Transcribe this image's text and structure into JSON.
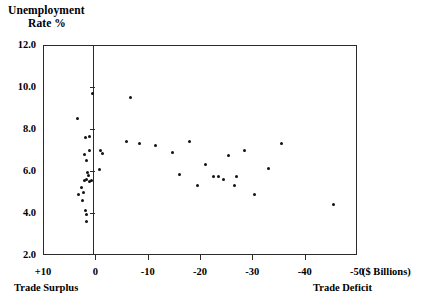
{
  "chart_data": {
    "type": "scatter",
    "title": "",
    "ylabel": "Unemployment Rate %",
    "ylabel_line1": "Unemployment",
    "ylabel_line2": "Rate %",
    "xlabel": "($ Billions)",
    "xlabel_left_note": "Trade Surplus",
    "xlabel_right_note": "Trade Deficit",
    "xlim": [
      10,
      -50
    ],
    "ylim": [
      2.0,
      12.0
    ],
    "grid": false,
    "legend": null,
    "x_ticks": [
      "+10",
      "0",
      "-10",
      "-20",
      "-30",
      "-40",
      "-50"
    ],
    "x_tick_values": [
      10,
      0,
      -10,
      -20,
      -30,
      -40,
      -50
    ],
    "y_ticks": [
      "2.0",
      "4.0",
      "6.0",
      "8.0",
      "10.0",
      "12.0"
    ],
    "y_tick_values": [
      2.0,
      4.0,
      6.0,
      8.0,
      10.0,
      12.0
    ],
    "zero_axis_x": 0,
    "points": [
      {
        "x": 3.5,
        "y": 8.5
      },
      {
        "x": 1.9,
        "y": 7.6
      },
      {
        "x": 1.2,
        "y": 7.65
      },
      {
        "x": 1.1,
        "y": 7.0
      },
      {
        "x": 0.5,
        "y": 9.7
      },
      {
        "x": 2.0,
        "y": 6.8
      },
      {
        "x": 1.6,
        "y": 6.5
      },
      {
        "x": 1.5,
        "y": 5.95
      },
      {
        "x": 1.4,
        "y": 5.8
      },
      {
        "x": 1.7,
        "y": 5.6
      },
      {
        "x": 2.0,
        "y": 5.55
      },
      {
        "x": 1.2,
        "y": 5.5
      },
      {
        "x": 0.7,
        "y": 5.55
      },
      {
        "x": 2.6,
        "y": 5.2
      },
      {
        "x": 2.2,
        "y": 5.0
      },
      {
        "x": 3.3,
        "y": 4.9
      },
      {
        "x": 2.4,
        "y": 4.6
      },
      {
        "x": 1.8,
        "y": 4.1
      },
      {
        "x": 1.7,
        "y": 3.95
      },
      {
        "x": 1.7,
        "y": 3.6
      },
      {
        "x": -1.0,
        "y": 7.0
      },
      {
        "x": -1.3,
        "y": 6.85
      },
      {
        "x": -0.8,
        "y": 6.05
      },
      {
        "x": -6.8,
        "y": 9.5
      },
      {
        "x": -6.0,
        "y": 7.4
      },
      {
        "x": -8.5,
        "y": 7.3
      },
      {
        "x": -11.5,
        "y": 7.2
      },
      {
        "x": -14.8,
        "y": 6.9
      },
      {
        "x": -16.0,
        "y": 5.85
      },
      {
        "x": -18.0,
        "y": 7.4
      },
      {
        "x": -19.5,
        "y": 5.3
      },
      {
        "x": -21.0,
        "y": 6.3
      },
      {
        "x": -22.5,
        "y": 5.75
      },
      {
        "x": -23.5,
        "y": 5.75
      },
      {
        "x": -24.5,
        "y": 5.6
      },
      {
        "x": -25.5,
        "y": 6.75
      },
      {
        "x": -26.5,
        "y": 5.3
      },
      {
        "x": -27.0,
        "y": 5.75
      },
      {
        "x": -30.5,
        "y": 4.9
      },
      {
        "x": -28.5,
        "y": 7.0
      },
      {
        "x": -33.0,
        "y": 6.1
      },
      {
        "x": -35.5,
        "y": 7.3
      },
      {
        "x": -45.5,
        "y": 4.4
      }
    ]
  },
  "style": {
    "axis_color": "#2b2b2b",
    "point_color": "#111111",
    "background": "#ffffff"
  }
}
